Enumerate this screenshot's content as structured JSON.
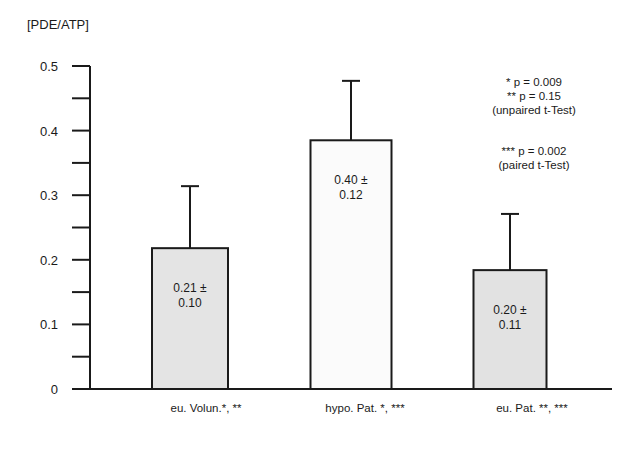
{
  "chart_data": {
    "type": "bar",
    "title": "",
    "ylabel": "[PDE/ATP]",
    "xlabel": "",
    "ylim": [
      0,
      0.5
    ],
    "yticks_major": [
      0,
      0.1,
      0.2,
      0.3,
      0.4,
      0.5
    ],
    "ytick_labels": [
      "0",
      "0.1",
      "0.2",
      "0.3",
      "0.4",
      "0.5"
    ],
    "yticks_minor": [
      0.05,
      0.15,
      0.25,
      0.35,
      0.45
    ],
    "grid": false,
    "categories": [
      "eu. Volun.*, **",
      "hypo. Pat. *, ***",
      "eu. Pat. **, ***"
    ],
    "values": [
      0.21,
      0.4,
      0.2
    ],
    "errors": [
      0.1,
      0.12,
      0.11
    ],
    "plotted_bar_heights": [
      0.218,
      0.385,
      0.184
    ],
    "plotted_error_tops": [
      0.314,
      0.477,
      0.271
    ],
    "bar_fills": [
      "#e4e4e4",
      "#fbfbfb",
      "#e2e2e2"
    ],
    "bar_labels": [
      [
        "0.21 ±",
        "0.10"
      ],
      [
        "0.40 ±",
        "0.12"
      ],
      [
        "0.20 ±",
        "0.11"
      ]
    ],
    "annotations": [
      "* p = 0.009",
      "** p = 0.15",
      "(unpaired t-Test)",
      "*** p = 0.002",
      "(paired t-Test)"
    ]
  }
}
